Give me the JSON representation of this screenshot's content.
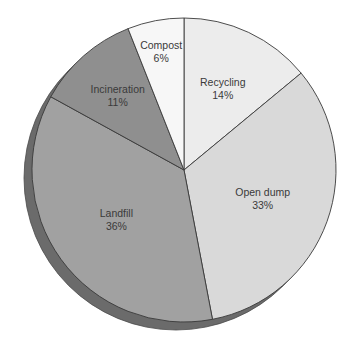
{
  "chart_data": {
    "type": "pie",
    "title": "",
    "categories": [
      "Recycling",
      "Open dump",
      "Landfill",
      "Incineration",
      "Compost"
    ],
    "values": [
      14,
      33,
      36,
      11,
      6
    ],
    "unit": "%",
    "start_angle_deg": 0,
    "direction": "clockwise",
    "legend": "none (labels inside slices)",
    "slices": [
      {
        "label": "Recycling",
        "value": 14,
        "value_label": "14%",
        "color": "#ececec"
      },
      {
        "label": "Open dump",
        "value": 33,
        "value_label": "33%",
        "color": "#d9d9d9"
      },
      {
        "label": "Landfill",
        "value": 36,
        "value_label": "36%",
        "color": "#a1a1a1"
      },
      {
        "label": "Incineration",
        "value": 11,
        "value_label": "11%",
        "color": "#8f8f8f"
      },
      {
        "label": "Compost",
        "value": 6,
        "value_label": "6%",
        "color": "#f7f7f7"
      }
    ],
    "style": {
      "shadow_color": "#6b6b6b",
      "border_color": "#3a3a3a",
      "label_color": "#3a3a3a"
    }
  }
}
